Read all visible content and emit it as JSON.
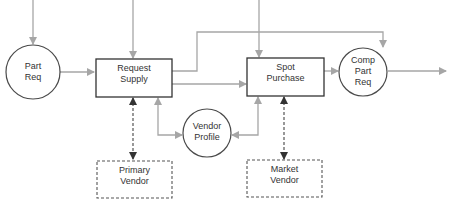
{
  "colors": {
    "flow_line": "#a6a6a6",
    "node_border": "#4a4a4a",
    "dashed_link": "#555555",
    "arrow_dark": "#333333",
    "text": "#333333",
    "background": "#ffffff"
  },
  "nodes": {
    "part_req": {
      "type": "circle",
      "lines": [
        "Part",
        "Req"
      ]
    },
    "request_supply": {
      "type": "process-box",
      "lines": [
        "Request",
        "Supply"
      ]
    },
    "spot_purchase": {
      "type": "process-box",
      "lines": [
        "Spot",
        "Purchase"
      ]
    },
    "comp_part_req": {
      "type": "circle",
      "lines": [
        "Comp",
        "Part",
        "Req"
      ]
    },
    "vendor_profile": {
      "type": "circle",
      "lines": [
        "Vendor",
        "Profile"
      ]
    },
    "primary_vendor": {
      "type": "dashed-box",
      "lines": [
        "Primary",
        "Vendor"
      ]
    },
    "market_vendor": {
      "type": "dashed-box",
      "lines": [
        "Market",
        "Vendor"
      ]
    }
  },
  "edges": [
    {
      "from": "top-input",
      "to": "part_req",
      "style": "solid-gray"
    },
    {
      "from": "top-input",
      "to": "request_supply",
      "style": "solid-gray"
    },
    {
      "from": "top-input",
      "to": "spot_purchase",
      "style": "solid-gray"
    },
    {
      "from": "part_req",
      "to": "request_supply",
      "style": "solid-gray"
    },
    {
      "from": "request_supply",
      "to": "spot_purchase",
      "style": "solid-gray"
    },
    {
      "from": "request_supply",
      "to": "comp_part_req",
      "style": "solid-gray"
    },
    {
      "from": "spot_purchase",
      "to": "comp_part_req",
      "style": "solid-gray"
    },
    {
      "from": "comp_part_req",
      "to": "output",
      "style": "solid-gray"
    },
    {
      "from": "vendor_profile",
      "to": "request_supply",
      "style": "solid-gray-bidirectional"
    },
    {
      "from": "vendor_profile",
      "to": "spot_purchase",
      "style": "solid-gray-bidirectional"
    },
    {
      "from": "primary_vendor",
      "to": "request_supply",
      "style": "dashed-dark-bidirectional"
    },
    {
      "from": "market_vendor",
      "to": "spot_purchase",
      "style": "dashed-dark-bidirectional"
    }
  ]
}
